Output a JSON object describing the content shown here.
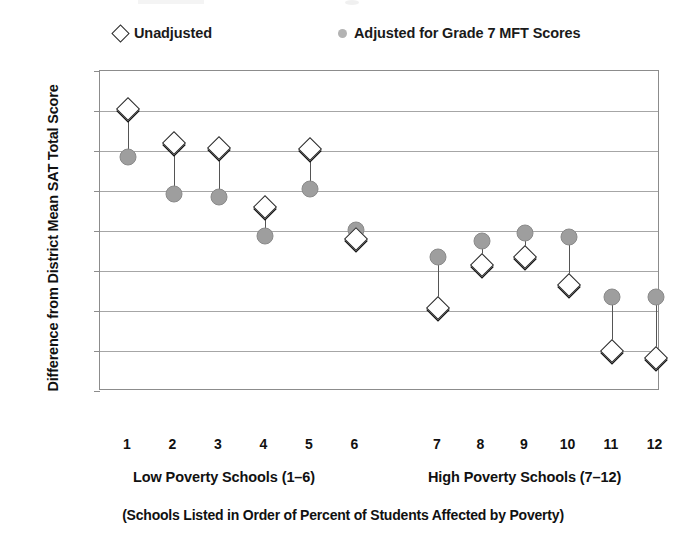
{
  "chart_data": {
    "type": "scatter",
    "title": "",
    "xlabel": "(Schools Listed in Order of Percent of Students Affected by Poverty)",
    "ylabel": "Difference from District Mean SAT Total Score",
    "ylim": [
      -200,
      200
    ],
    "yticks": [
      200,
      150,
      100,
      50,
      0,
      -50,
      -100,
      -150,
      -200
    ],
    "ytick_labels": [
      "200",
      "150",
      "100",
      "50",
      "0",
      "-50",
      "-100",
      "-150",
      "-200"
    ],
    "categories": [
      "1",
      "2",
      "3",
      "4",
      "5",
      "6",
      "7",
      "8",
      "9",
      "10",
      "11",
      "12"
    ],
    "grid": true,
    "legend_position": "top",
    "series": [
      {
        "name": "Unadjusted",
        "marker": "diamond-open",
        "color": "#ffffff",
        "edge_color": "#2b2b2b",
        "values": [
          153,
          110,
          104,
          30,
          102,
          -10,
          -96,
          -43,
          -33,
          -68,
          -150,
          -159
        ]
      },
      {
        "name": "Adjusted for Grade 7 MFT Scores",
        "marker": "circle-filled",
        "color": "#9e9e9e",
        "values": [
          92,
          46,
          43,
          -6,
          53,
          1,
          -33,
          -12,
          -2,
          -8,
          -83,
          -83
        ]
      }
    ],
    "groups": [
      {
        "label": "Low Poverty Schools (1–6)",
        "schools": [
          "1",
          "2",
          "3",
          "4",
          "5",
          "6"
        ]
      },
      {
        "label": "High Poverty Schools (7–12)",
        "schools": [
          "7",
          "8",
          "9",
          "10",
          "11",
          "12"
        ]
      }
    ]
  },
  "legend": {
    "unadjusted_label": "Unadjusted",
    "adjusted_label": "Adjusted for Grade 7 MFT Scores"
  },
  "axes": {
    "y_title": "Difference from District Mean SAT Total Score"
  },
  "captions": {
    "low_poverty": "Low Poverty Schools (1–6)",
    "high_poverty": "High Poverty Schools (7–12)",
    "footnote": "(Schools Listed in Order of Percent of Students Affected by Poverty)"
  },
  "colors": {
    "adjusted_marker": "#9e9e9e",
    "unadjusted_marker_edge": "#2b2b2b",
    "gridline": "#a6a6a6",
    "frame": "#8c8c8c",
    "text": "#111111"
  }
}
